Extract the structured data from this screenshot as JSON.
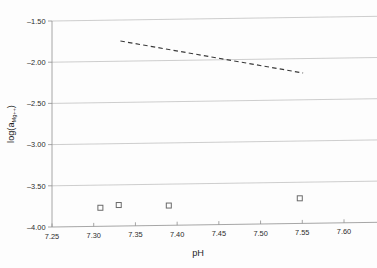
{
  "chart_data": {
    "type": "scatter",
    "title": "",
    "xlabel": "pH",
    "ylabel": "log(a_Mg++)",
    "ylabel_main": "log(a",
    "ylabel_sub": "Mg++",
    "ylabel_close": ")",
    "xlim": [
      7.25,
      7.6
    ],
    "ylim": [
      -4.0,
      -1.5
    ],
    "xticks": [
      "7.25",
      "7.30",
      "7.35",
      "7.40",
      "7.45",
      "7.50",
      "7.55",
      "7.60"
    ],
    "xtick_values": [
      7.25,
      7.3,
      7.35,
      7.4,
      7.45,
      7.5,
      7.55,
      7.6
    ],
    "yticks": [
      "-1.50",
      "-2.00",
      "-2.50",
      "-3.00",
      "-3.50",
      "-4.00"
    ],
    "ytick_values": [
      -1.5,
      -2.0,
      -2.5,
      -3.0,
      -3.5,
      -4.0
    ],
    "grid": true,
    "legend": "none",
    "series": [
      {
        "name": "measured",
        "marker": "open-square",
        "points": [
          {
            "x": 7.308,
            "y": -3.775
          },
          {
            "x": 7.33,
            "y": -3.745
          },
          {
            "x": 7.39,
            "y": -3.76
          },
          {
            "x": 7.547,
            "y": -3.695
          }
        ]
      },
      {
        "name": "trend",
        "style": "dashed-line",
        "points": [
          {
            "x": 7.332,
            "y": -1.755
          },
          {
            "x": 7.551,
            "y": -2.175
          }
        ]
      }
    ]
  },
  "colors": {
    "grid": "#b9b9b9",
    "axis": "#8f8f8f",
    "marker": "#6a6a6a",
    "trend": "#3a3a3a",
    "text": "#2b2b2b",
    "background": "#fdfdfd"
  }
}
